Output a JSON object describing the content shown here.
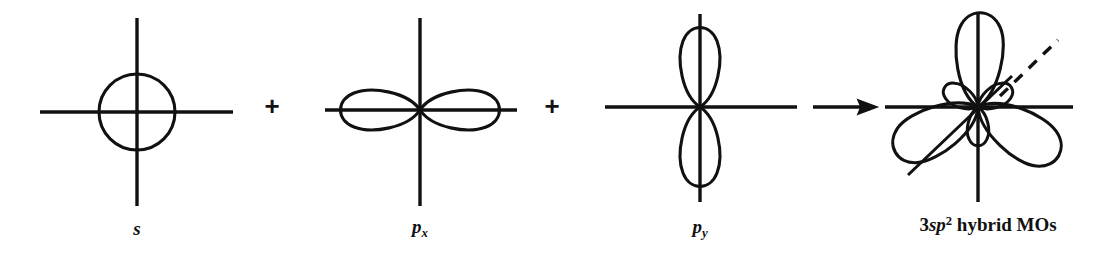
{
  "figure": {
    "type": "orbital-hybridization-diagram",
    "background_color": "#ffffff",
    "stroke_color": "#111111"
  },
  "operators": [
    {
      "name": "plus-1",
      "symbol": "+",
      "x": 272,
      "y": 107
    },
    {
      "name": "plus-2",
      "symbol": "+",
      "x": 552,
      "y": 107
    },
    {
      "name": "arrow",
      "symbol": "→",
      "x": 845,
      "y": 107
    }
  ],
  "terms": [
    {
      "id": "s",
      "label_html": "s",
      "label_plain": "s",
      "label_x": 137,
      "label_y": 228,
      "center": {
        "x": 137,
        "y": 112
      },
      "axes": {
        "x_start": 40,
        "x_end": 233,
        "y_start": 18,
        "y_end": 206
      },
      "shape": "circle",
      "radius": 38
    },
    {
      "id": "px",
      "label_html": "p<sub>x</sub>",
      "label_plain": "px",
      "label_x": 420,
      "label_y": 228,
      "center": {
        "x": 420,
        "y": 110
      },
      "axes": {
        "x_start": 325,
        "x_end": 517,
        "y_start": 18,
        "y_end": 206
      },
      "shape": "two-horizontal-lobes",
      "lobe_length": 72,
      "lobe_width": 32
    },
    {
      "id": "py",
      "label_html": "p<sub>y</sub>",
      "label_plain": "py",
      "label_x": 700,
      "label_y": 228,
      "center": {
        "x": 700,
        "y": 107
      },
      "axes": {
        "x_start": 605,
        "x_end": 797,
        "y_start": 14,
        "y_end": 202
      },
      "shape": "two-vertical-lobes",
      "lobe_length": 72,
      "lobe_width": 32
    },
    {
      "id": "hybrid",
      "label_html": "3<span class=\"it\">sp</span><sup>2</sup> <span class=\"rm\">hybrid MOs</span>",
      "label_plain": "3sp2 hybrid MOs",
      "label_x": 988,
      "label_y": 228,
      "center": {
        "x": 978,
        "y": 107
      },
      "axes": {
        "x_start": 885,
        "x_end": 1073,
        "y_start": 14,
        "y_end": 202
      },
      "shape": "three-sp2-hybrid-lobes",
      "lobe_angles_deg": [
        90,
        210,
        330
      ],
      "major_lobe_length": 93,
      "major_lobe_width": 40,
      "minor_lobe_length": 33,
      "minor_lobe_width": 20,
      "extra_lines": [
        {
          "name": "sigma-bond-axis",
          "style": "solid",
          "x1": 908,
          "y1": 175,
          "x2": 1010,
          "y2": 78
        },
        {
          "name": "z-axis-dashed",
          "style": "dashed",
          "x1": 1000,
          "y1": 96,
          "x2": 1058,
          "y2": 40
        }
      ]
    }
  ]
}
